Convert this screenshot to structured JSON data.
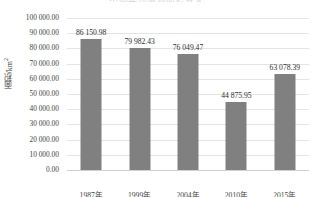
{
  "chart_data": {
    "type": "bar",
    "title": "不同年份湿地面积变化",
    "xlabel": "",
    "ylabel": "面积/km",
    "ylabel_superscript": "2",
    "categories": [
      "1987年",
      "1999年",
      "2004年",
      "2010年",
      "2015年"
    ],
    "values": [
      86150.98,
      79982.43,
      76049.47,
      44875.95,
      63078.39
    ],
    "value_labels": [
      "86 150.98",
      "79 982.43",
      "76 049.47",
      "44 875.95",
      "63 078.39"
    ],
    "ylim": [
      0,
      100000
    ],
    "ytick_values": [
      100000,
      90000,
      80000,
      70000,
      60000,
      50000,
      40000,
      30000,
      20000,
      10000,
      0
    ],
    "ytick_labels": [
      "100 000.00",
      "90 000.00",
      "80 000.00",
      "70 000.00",
      "60 000.00",
      "50 000.00",
      "40 000.00",
      "30 000.00",
      "20 000.00",
      "10 000.00",
      "0.00"
    ],
    "grid": true,
    "legend": false,
    "series_color": "#808080",
    "gridline_color": "#e4e4e4",
    "axis_color": "#cfcfcf",
    "text_color": "#3f3f3f",
    "background": "#ffffff"
  }
}
